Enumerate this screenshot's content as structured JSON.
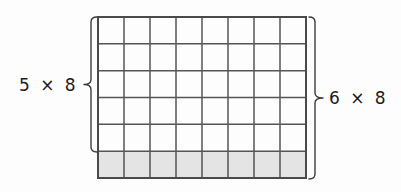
{
  "figure": {
    "kind": "array-model-multiplication-diagram",
    "background_color": "#fdfdfd"
  },
  "grid": {
    "rows": 6,
    "columns": 8,
    "x": 98,
    "y": 17,
    "width": 208,
    "height": 161,
    "cell_width": 26,
    "cell_height": 26.83,
    "line_color": "#555555",
    "line_width": 1.5,
    "outer_line_color": "#4a4a4a",
    "outer_line_width": 2,
    "cell_fill": "#ffffff",
    "shaded_rows": [
      5
    ],
    "shaded_fill": "#e4e4e4",
    "shaded_row_count": 1,
    "unshaded_row_count": 5
  },
  "braces": {
    "left": {
      "name": "left-brace",
      "label": "5 × 8",
      "spans_rows": 5,
      "top": 17,
      "bottom": 152,
      "stem_x": 91,
      "tip_x": 84,
      "tip_y": 84.5,
      "color": "#3c3c3c",
      "stroke_width": 1.4
    },
    "right": {
      "name": "right-brace",
      "label": "6 × 8",
      "spans_rows": 6,
      "top": 17,
      "bottom": 179,
      "stem_x": 315,
      "tip_x": 323,
      "tip_y": 98,
      "color": "#3c3c3c",
      "stroke_width": 1.4
    }
  },
  "labels": {
    "left_expression": "5 × 8",
    "right_expression": "6 × 8",
    "text_color": "#1c1c1c",
    "font_size_px": 17
  }
}
